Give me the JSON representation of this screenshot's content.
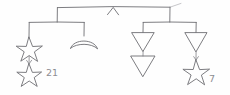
{
  "diagram": {
    "style": {
      "background": "#fefefe",
      "ink": "#6e6e73",
      "ink_soft": "#8b8b90",
      "ink_faint": "#b9b9bd"
    },
    "root": {
      "name": "top-bar",
      "caret_symbol": "∧",
      "bar_left_x": 57,
      "bar_right_x": 170,
      "bar_y": 7,
      "caret_x": 113
    },
    "branches": [
      {
        "id": "left",
        "name": "left-branch",
        "bar_left_x": 29,
        "bar_right_x": 84,
        "bar_y": 22,
        "drop_x": 57,
        "children": [
          {
            "id": "left-outer",
            "shape": "star",
            "count": 2,
            "stacked": true,
            "label": "21"
          },
          {
            "id": "left-inner",
            "shape": "crescent",
            "count": 1,
            "stacked": false,
            "label": ""
          }
        ]
      },
      {
        "id": "right",
        "name": "right-branch",
        "bar_left_x": 143,
        "bar_right_x": 196,
        "bar_y": 22,
        "drop_x": 170,
        "children": [
          {
            "id": "right-inner",
            "shape": "triangle-down",
            "count": 2,
            "stacked": true,
            "label": ""
          },
          {
            "id": "right-outer",
            "shape": "triangle-down-over-star",
            "count": 2,
            "stacked": true,
            "label": "7"
          }
        ]
      }
    ],
    "annotations": [
      {
        "id": "annotation-21",
        "text": "21",
        "x": 51,
        "y": 74
      },
      {
        "id": "annotation-7",
        "text": "7",
        "x": 212,
        "y": 79
      }
    ]
  }
}
